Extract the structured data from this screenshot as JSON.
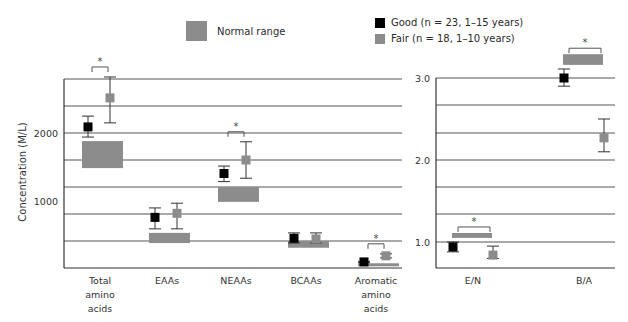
{
  "legend": {
    "normal_range": "Normal range",
    "good": "Good (n = 23, 1–15 years)",
    "fair": "Fair (n = 18, 1–10 years)"
  },
  "colors": {
    "good": "#000000",
    "fair": "#8c8c8c",
    "normal_range": "#8c8c8c",
    "gridline": "#555555"
  },
  "chart_data": [
    {
      "type": "scatter",
      "title": "",
      "xlabel": "",
      "ylabel": "Concentration (M/L)",
      "ylim": [
        0,
        2800
      ],
      "yticks": [
        1000,
        2000
      ],
      "gridlines": [
        400,
        800,
        1200,
        1600,
        2000,
        2400,
        2800
      ],
      "grid": true,
      "legend_position": "top",
      "categories": [
        "Total amino acids",
        "EAAs",
        "NEAAs",
        "BCAAs",
        "Aromatic amino acids"
      ],
      "normal_range": [
        [
          1480,
          1880
        ],
        [
          370,
          520
        ],
        [
          980,
          1200
        ],
        [
          300,
          400
        ],
        [
          50,
          70
        ]
      ],
      "series": [
        {
          "name": "Good (n = 23, 1–15 years)",
          "values": [
            2090,
            750,
            1400,
            440,
            90
          ],
          "err_low": [
            1940,
            580,
            1280,
            370,
            80
          ],
          "err_high": [
            2250,
            890,
            1510,
            520,
            100
          ]
        },
        {
          "name": "Fair (n = 18, 1–10 years)",
          "values": [
            2520,
            810,
            1600,
            430,
            180
          ],
          "err_low": [
            2150,
            580,
            1330,
            370,
            150
          ],
          "err_high": [
            2830,
            960,
            1870,
            520,
            210
          ]
        }
      ],
      "significance": [
        true,
        false,
        true,
        false,
        true
      ],
      "annotations": [
        "*",
        "",
        "*",
        "",
        "*"
      ]
    },
    {
      "type": "scatter",
      "title": "",
      "xlabel": "",
      "ylabel": "",
      "ylim": [
        0.68,
        3.0
      ],
      "yticks": [
        1.0,
        2.0,
        3.0
      ],
      "grid": true,
      "categories": [
        "E/N",
        "B/A"
      ],
      "normal_range": [
        [
          1.05,
          1.11
        ],
        [
          3.16,
          3.29
        ]
      ],
      "series": [
        {
          "name": "Good (n = 23, 1–15 years)",
          "values": [
            0.94,
            3.0
          ],
          "err_low": [
            0.88,
            2.9
          ],
          "err_high": [
            1.0,
            3.11
          ]
        },
        {
          "name": "Fair (n = 18, 1–10 years)",
          "values": [
            0.84,
            2.27
          ],
          "err_low": [
            0.8,
            2.1
          ],
          "err_high": [
            0.95,
            2.5
          ]
        }
      ],
      "significance": [
        true,
        true
      ],
      "annotations": [
        "*",
        "*"
      ]
    }
  ]
}
